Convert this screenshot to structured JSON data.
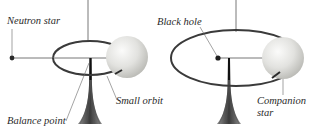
{
  "diagram": {
    "left_panel": {
      "labels": {
        "compact_object": "Neutron star",
        "small_orbit": "Small orbit",
        "balance_point": "Balance point"
      }
    },
    "right_panel": {
      "labels": {
        "compact_object": "Black hole",
        "companion_line1": "Companion",
        "companion_line2": "star"
      }
    },
    "colors": {
      "orbit": "#3a3a3a",
      "line": "#555555",
      "sphere_light": "#f4f4f2",
      "sphere_dark": "#bdbdb8",
      "stand_dark": "#2e2e2e",
      "stand_light": "#9a9a9a"
    }
  }
}
